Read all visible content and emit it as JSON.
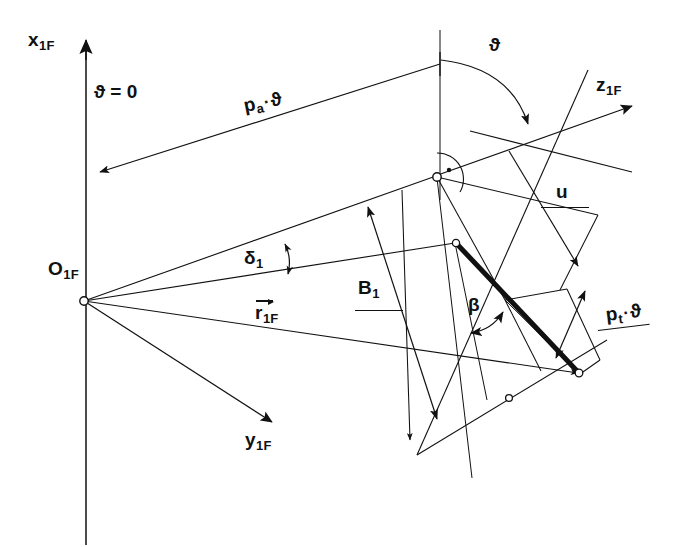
{
  "figure": {
    "kind": "engineering-geometry-diagram",
    "background_color": "#ffffff",
    "line_color": "#111111",
    "width": 684,
    "height": 547
  },
  "axes": [
    {
      "id": "x1F",
      "name": "x-axis-1F",
      "label": "x",
      "subscript": "1F",
      "direction": "up",
      "description": "vertical axis pointing up with arrowhead"
    },
    {
      "id": "y1F",
      "name": "y-axis-1F",
      "label": "y",
      "subscript": "1F",
      "direction": "down-right",
      "description": "axis from origin pointing down and to the right"
    },
    {
      "id": "z1F",
      "name": "z-axis-1F",
      "label": "z",
      "subscript": "1F",
      "direction": "up-right",
      "description": "axis pointing up and to the right with arrowhead"
    }
  ],
  "origin": {
    "label": "O",
    "subscript": "1F",
    "name": "origin-point-O1F"
  },
  "annotations": [
    {
      "id": "theta-zero",
      "name": "theta-zero-label",
      "text": "ϑ = 0",
      "base": "ϑ",
      "operator": "=",
      "value": "0",
      "placement": "along vertical x1F axis"
    },
    {
      "id": "pa-theta",
      "name": "pa-theta-dimension-label",
      "base": "p",
      "subscript": "a",
      "operator": "·",
      "factor": "ϑ",
      "text": "pₐ·ϑ",
      "placement": "rotated along upper long dimension line"
    },
    {
      "id": "theta-angle",
      "name": "theta-angle-label",
      "text": "ϑ",
      "placement": "at top arc between vertical and z1F direction"
    },
    {
      "id": "u-dimension",
      "name": "u-dimension-label",
      "text": "u",
      "placement": "right side with leader underline and arrow"
    },
    {
      "id": "delta-1",
      "name": "delta-1-angle-label",
      "base": "δ",
      "subscript": "1",
      "text": "δ₁",
      "placement": "double-headed arc near origin rays"
    },
    {
      "id": "r-1F",
      "name": "r-1F-vector-label",
      "base": "r",
      "subscript": "1F",
      "text": "r⃗₁ꜰ",
      "vector": true,
      "placement": "vector with overbar arrow along middle ray"
    },
    {
      "id": "B-1",
      "name": "B-1-dimension-label",
      "base": "B",
      "subscript": "1",
      "text": "B₁",
      "placement": "with leader underline on central double-arrow"
    },
    {
      "id": "beta",
      "name": "beta-angle-label",
      "text": "β",
      "placement": "double-headed arc at thick bold line"
    },
    {
      "id": "pt-theta",
      "name": "pt-theta-dimension-label",
      "base": "p",
      "subscript": "t",
      "operator": "·",
      "factor": "ϑ",
      "text": "pₜ·ϑ",
      "placement": "lower right with leader underline and double arrow"
    }
  ],
  "markers": {
    "right_angle": {
      "name": "right-angle-marker",
      "symbol": "·",
      "description": "dot inside arc indicating perpendicularity at upper node"
    },
    "node_count": 6,
    "node_style": "small open circle"
  }
}
